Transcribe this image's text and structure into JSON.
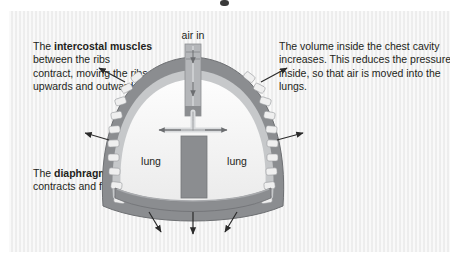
{
  "figure": {
    "labels": {
      "air_in": "air in",
      "lung_left": "lung",
      "lung_right": "lung"
    },
    "colors": {
      "background": "#f2f2f2",
      "chest_wall": "#8b8d90",
      "wall_inner": "#b9bbbd",
      "rib_block": "#efefef",
      "lung_fill": "#f7f7f7",
      "mediastinum": "#8b8d90",
      "trachea": "#a8aaad",
      "arrow": "#2b2b2b",
      "text": "#231f20"
    },
    "arrows": {
      "air_in_down": 2,
      "ribs_outward_left": 2,
      "ribs_outward_right": 2,
      "bronchi_horizontal": 2,
      "diaphragm_down": 3
    }
  },
  "annotations": {
    "intercostal": {
      "lead": "The ",
      "bold": "intercostal muscles",
      "rest": " between the ribs contract, moving the ribs upwards and outwards."
    },
    "diaphragm": {
      "lead": "The ",
      "bold": "diaphragm",
      "rest": " contracts and flattens."
    },
    "volume": {
      "text": "The volume inside the chest cavity increases. This reduces the pressure inside, so that air is moved into the lungs."
    }
  }
}
